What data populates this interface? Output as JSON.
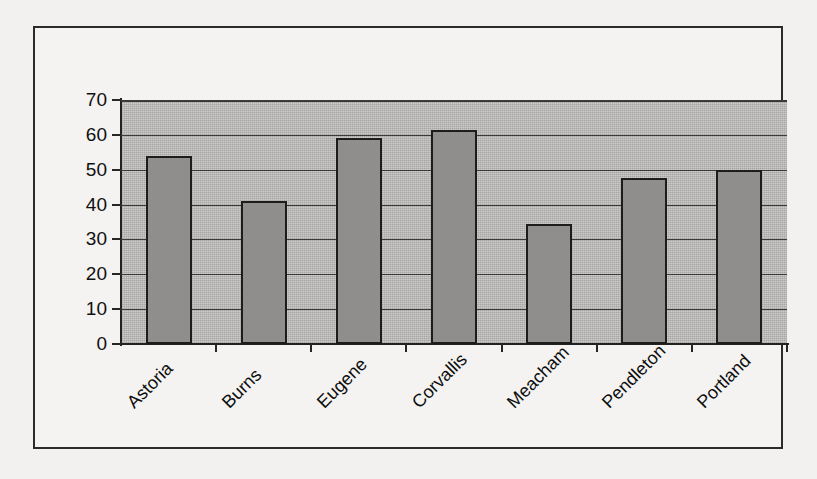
{
  "chart_data": {
    "type": "bar",
    "title": "",
    "subtitle": "",
    "xlabel": "",
    "ylabel": "",
    "categories": [
      "Astoria",
      "Burns",
      "Eugene",
      "Corvallis",
      "Meacham",
      "Pendleton",
      "Portland"
    ],
    "values": [
      54,
      41,
      59,
      61.5,
      34.5,
      47.5,
      50
    ],
    "series": [
      {
        "name": "",
        "values": [
          54,
          41,
          59,
          61.5,
          34.5,
          47.5,
          50
        ]
      }
    ],
    "ylim": [
      0,
      70
    ],
    "y_ticks": [
      0,
      10,
      20,
      30,
      40,
      50,
      60,
      70
    ],
    "y_tick_labels": [
      "0",
      "10",
      "20",
      "30",
      "40",
      "50",
      "60",
      "70"
    ],
    "grid": "horizontal",
    "legend": "none",
    "annotations": [],
    "colors": {
      "bar_fill": "#8f8e8c",
      "bar_border": "#1c1c1c",
      "plot_background": "#b7b6b4",
      "chart_background": "#f4f3f1",
      "axis": "#262626",
      "gridline": "#3a3a3a",
      "text": "#101010",
      "page_background": "#f2f1ef"
    },
    "label_rotation_degrees": -45
  }
}
